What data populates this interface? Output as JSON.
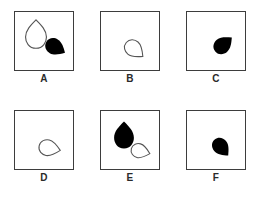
{
  "figure": {
    "title": "",
    "layout": {
      "rows": 2,
      "columns": 3,
      "panel_size_px": 60,
      "background_color": "#ffffff",
      "border_color": "#3d3d3d",
      "fill_black": "#000000",
      "outline_color": "#555555"
    }
  },
  "panels": [
    {
      "id": "panel-a",
      "label": "A",
      "shape_count": 2,
      "shapes": [
        {
          "name": "teardrop-outline-down",
          "style": "outline",
          "fill": "none",
          "stroke": "#555555",
          "orientation_degrees": 180,
          "description": "white outlined teardrop, bulb at top, tip pointing down",
          "center_x": 22,
          "center_y": 24,
          "size": 26
        },
        {
          "name": "teardrop-filled-down-right",
          "style": "filled",
          "fill": "#000000",
          "stroke": "none",
          "orientation_degrees": 300,
          "description": "black filled teardrop, tip pointing left, bulb at right",
          "center_x": 40,
          "center_y": 35,
          "size": 20
        }
      ]
    },
    {
      "id": "panel-b",
      "label": "B",
      "shape_count": 1,
      "shapes": [
        {
          "name": "teardrop-outline-up-left",
          "style": "outline",
          "fill": "none",
          "stroke": "#555555",
          "orientation_degrees": 310,
          "description": "white outlined teardrop, tip pointing up-left, bulb at lower-right",
          "center_x": 34,
          "center_y": 38,
          "size": 20
        }
      ]
    },
    {
      "id": "panel-c",
      "label": "C",
      "shape_count": 1,
      "shapes": [
        {
          "name": "teardrop-filled-down-left",
          "style": "filled",
          "fill": "#000000",
          "stroke": "none",
          "orientation_degrees": 230,
          "description": "black filled teardrop, tip pointing down-left, bulb at upper-right",
          "center_x": 36,
          "center_y": 34,
          "size": 20
        }
      ]
    },
    {
      "id": "panel-d",
      "label": "D",
      "shape_count": 1,
      "shapes": [
        {
          "name": "teardrop-outline-left",
          "style": "outline",
          "fill": "none",
          "stroke": "#555555",
          "orientation_degrees": 280,
          "description": "white outlined teardrop, tip pointing left, bulb at right",
          "center_x": 35,
          "center_y": 38,
          "size": 20
        }
      ]
    },
    {
      "id": "panel-e",
      "label": "E",
      "shape_count": 2,
      "shapes": [
        {
          "name": "teardrop-filled-down",
          "style": "filled",
          "fill": "#000000",
          "stroke": "none",
          "orientation_degrees": 180,
          "description": "black filled teardrop, bulb at top, tip pointing down",
          "center_x": 24,
          "center_y": 25,
          "size": 24
        },
        {
          "name": "teardrop-outline-left",
          "style": "outline",
          "fill": "none",
          "stroke": "#555555",
          "orientation_degrees": 285,
          "description": "white outlined teardrop, tip pointing left, bulb at right",
          "center_x": 40,
          "center_y": 41,
          "size": 18
        }
      ]
    },
    {
      "id": "panel-f",
      "label": "F",
      "shape_count": 1,
      "shapes": [
        {
          "name": "teardrop-filled-up-left",
          "style": "filled",
          "fill": "#000000",
          "stroke": "none",
          "orientation_degrees": 320,
          "description": "black filled teardrop, tip pointing up-left, bulb at lower-right",
          "center_x": 35,
          "center_y": 37,
          "size": 19
        }
      ]
    }
  ]
}
